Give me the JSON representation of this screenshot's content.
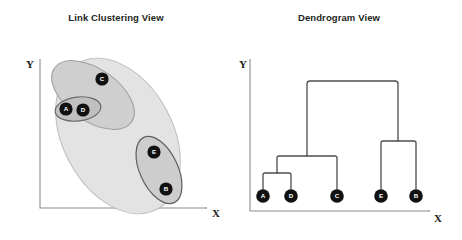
{
  "figure": {
    "width": 462,
    "height": 240,
    "background": "#ffffff"
  },
  "panels": [
    {
      "id": "link-clustering",
      "title": "Link Clustering View",
      "title_x": 116,
      "title_y": 21,
      "axes": {
        "y_label": "Y",
        "y_label_x": 26,
        "y_label_y": 68,
        "x_label": "X",
        "x_label_x": 212,
        "x_label_y": 217,
        "origin_x": 40,
        "origin_y": 208,
        "y_top": 59,
        "x_right": 205,
        "line_color": "#8c8c8c"
      },
      "ellipses": [
        {
          "name": "outer-cluster-ellipse",
          "cx": 118,
          "cy": 136,
          "rx": 55,
          "ry": 83,
          "rotate": -28,
          "fill": "#e3e3e3",
          "stroke": "#bdbdbd",
          "opacity": 1
        },
        {
          "name": "cluster-acd-ellipse",
          "cx": 93,
          "cy": 95,
          "rx": 26,
          "ry": 47,
          "rotate": -55,
          "fill": "#cfcfcf",
          "stroke": "#9e9e9e",
          "opacity": 1
        },
        {
          "name": "cluster-ad-ellipse",
          "cx": 78,
          "cy": 109,
          "rx": 23,
          "ry": 12,
          "rotate": -7,
          "fill": "#c0c0c0",
          "stroke": "#6b6b6b",
          "opacity": 1
        },
        {
          "name": "cluster-eb-ellipse",
          "cx": 159,
          "cy": 170,
          "rx": 19,
          "ry": 36,
          "rotate": -25,
          "fill": "#cdcdcd",
          "stroke": "#5e5e5e",
          "opacity": 1
        }
      ],
      "nodes": [
        {
          "label": "A",
          "x": 66,
          "y": 109,
          "r": 6.6
        },
        {
          "label": "D",
          "x": 83,
          "y": 110,
          "r": 6.6
        },
        {
          "label": "C",
          "x": 102,
          "y": 79,
          "r": 6.6
        },
        {
          "label": "E",
          "x": 154,
          "y": 152,
          "r": 6.6
        },
        {
          "label": "B",
          "x": 166,
          "y": 189,
          "r": 6.6
        }
      ]
    },
    {
      "id": "dendrogram",
      "title": "Dendrogram View",
      "title_x": 339,
      "title_y": 21,
      "axes": {
        "y_label": "Y",
        "y_label_x": 239,
        "y_label_y": 68,
        "x_label": "X",
        "x_label_x": 434,
        "x_label_y": 222,
        "origin_x": 250,
        "origin_y": 211,
        "y_top": 59,
        "x_right": 428,
        "line_color": "#8c8c8c"
      },
      "nodes": [
        {
          "label": "A",
          "x": 263,
          "y": 196,
          "r": 6.8
        },
        {
          "label": "D",
          "x": 291,
          "y": 196,
          "r": 6.8
        },
        {
          "label": "C",
          "x": 337,
          "y": 196,
          "r": 6.8
        },
        {
          "label": "E",
          "x": 381,
          "y": 196,
          "r": 6.8
        },
        {
          "label": "B",
          "x": 416,
          "y": 196,
          "r": 6.8
        }
      ],
      "merges": [
        {
          "name": "merge-a-d",
          "left_x": 263,
          "right_x": 291,
          "height_y": 173,
          "leaf_top_y": 189
        },
        {
          "name": "merge-ad-c",
          "left_x": 277,
          "right_x": 337,
          "height_y": 156,
          "leaf_top_y": 189
        },
        {
          "name": "merge-e-b",
          "left_x": 381,
          "right_x": 416,
          "height_y": 141,
          "leaf_top_y": 189
        },
        {
          "name": "merge-root",
          "left_x": 307,
          "right_x": 398,
          "height_y": 81,
          "leaf_top_y": 189
        }
      ]
    }
  ]
}
